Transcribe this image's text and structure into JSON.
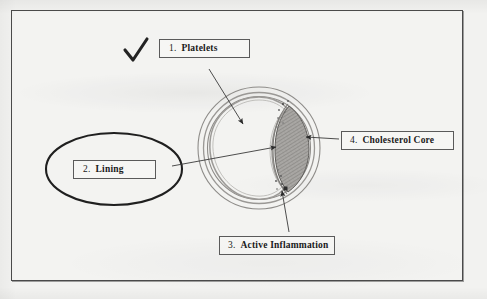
{
  "page": {
    "kind": "scanned-hand-annotated-diagram",
    "paper_color": "#f2f2f0",
    "frame_color": "#4a4a4a",
    "ink_color": "#3a3a3a"
  },
  "marks": {
    "checkmark": {
      "name": "checkmark",
      "glyph": "check-mark",
      "color": "#2a2a2a"
    }
  },
  "callouts": [
    {
      "id": "platelets",
      "number": "1.",
      "text": "Platelets",
      "points_to": "lumen"
    },
    {
      "id": "lining",
      "number": "2.",
      "text": "Lining",
      "points_to": "endothelial-lining",
      "circled": true
    },
    {
      "id": "inflammation",
      "number": "3.",
      "text": "Active Inflammation",
      "points_to": "inflammation-site"
    },
    {
      "id": "cholesterol",
      "number": "4.",
      "text": "Cholesterol Core",
      "points_to": "cholesterol-core"
    }
  ],
  "diagram": {
    "outer_wall": {
      "cx": 259,
      "cy": 148,
      "r": 61
    },
    "media_layer": {
      "cx": 259,
      "cy": 148,
      "r": 55
    },
    "intima_layer": {
      "cx": 259,
      "cy": 148,
      "r": 51
    },
    "lumen_label": "lumen",
    "cholesterol_core_label": "cholesterol-core",
    "inflammation_sites": 2
  }
}
